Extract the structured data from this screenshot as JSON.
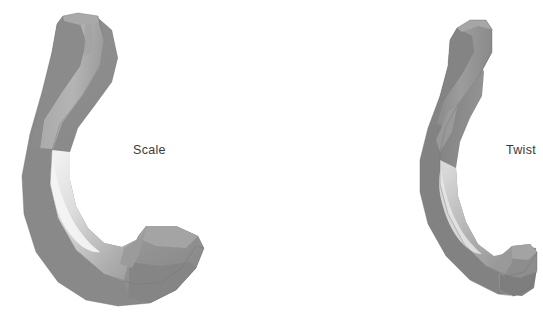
{
  "figure": {
    "background_color": "#ffffff",
    "width": 543,
    "height": 331
  },
  "labels": {
    "left": "Scale",
    "right": "Twist",
    "text_color": "#3a3a3a"
  },
  "models": [
    {
      "name": "scale-hook",
      "label": "Scale",
      "side": "left",
      "bbox": [
        18,
        14,
        200,
        307
      ],
      "shading": {
        "highlight": "#e8e8e8",
        "light": "#b8b8b8",
        "mid": "#9a9a9a",
        "base": "#8e8e8e",
        "dark": "#7c7c7c",
        "outline": "#6e6e6e"
      }
    },
    {
      "name": "twist-hook",
      "label": "Twist",
      "side": "right",
      "bbox": [
        408,
        20,
        537,
        302
      ],
      "shading": {
        "highlight": "#e0e0e0",
        "light": "#b5b5b5",
        "mid": "#9b9b9b",
        "base": "#8d8d8d",
        "dark": "#787878",
        "outline": "#6a6a6a"
      }
    }
  ],
  "palette": {
    "highlight": "#e8e8e8",
    "light": "#b8b8b8",
    "mid": "#9a9a9a",
    "base": "#8e8e8e",
    "dark": "#7c7c7c",
    "darkest": "#6e6e6e",
    "background": "#ffffff",
    "label": "#3a3a3a"
  }
}
